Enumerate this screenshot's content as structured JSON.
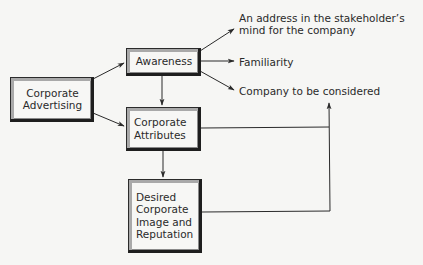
{
  "diagram": {
    "type": "flow",
    "nodes": {
      "corporate_advertising": {
        "lines": [
          "Corporate",
          "Advertising"
        ]
      },
      "awareness": {
        "lines": [
          "Awareness"
        ]
      },
      "corporate_attributes": {
        "lines": [
          "Corporate",
          "Attributes"
        ]
      },
      "desired_image": {
        "lines": [
          "Desired",
          "Corporate",
          "Image and",
          "Reputation"
        ]
      }
    },
    "outcomes": {
      "address": {
        "lines": [
          "An address in the stakeholder’s",
          "mind for the company"
        ]
      },
      "familiarity": {
        "lines": [
          "Familiarity"
        ]
      },
      "considered": {
        "lines": [
          "Company to be considered"
        ]
      }
    },
    "edges": [
      {
        "from": "Corporate Advertising",
        "to": "Awareness"
      },
      {
        "from": "Corporate Advertising",
        "to": "Corporate Attributes"
      },
      {
        "from": "Awareness",
        "to": "Corporate Attributes"
      },
      {
        "from": "Corporate Attributes",
        "to": "Desired Corporate Image and Reputation"
      },
      {
        "from": "Awareness",
        "to": "An address in the stakeholder’s mind for the company"
      },
      {
        "from": "Awareness",
        "to": "Familiarity"
      },
      {
        "from": "Awareness",
        "to": "Company to be considered"
      },
      {
        "from": "Corporate Attributes",
        "to": "Company to be considered"
      },
      {
        "from": "Desired Corporate Image and Reputation",
        "to": "Company to be considered"
      }
    ],
    "colors": {
      "background": "#f6f6f4",
      "line": "#2a2a2a",
      "bevel": "#a9a9a9",
      "shadow": "#1e1e1e"
    }
  }
}
